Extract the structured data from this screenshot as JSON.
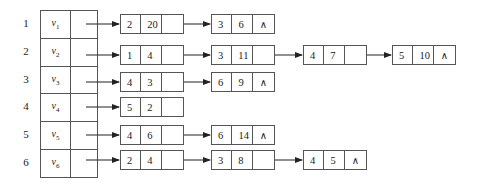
{
  "diagram": {
    "type": "adjacency-list",
    "null_symbol": "∧",
    "vertices": [
      {
        "index": "1",
        "name": "v",
        "sub": "1",
        "edges": [
          {
            "adj": "2",
            "weight": "20"
          },
          {
            "adj": "3",
            "weight": "6"
          }
        ]
      },
      {
        "index": "2",
        "name": "v",
        "sub": "2",
        "edges": [
          {
            "adj": "1",
            "weight": "4"
          },
          {
            "adj": "3",
            "weight": "11"
          },
          {
            "adj": "4",
            "weight": "7"
          },
          {
            "adj": "5",
            "weight": "10"
          }
        ]
      },
      {
        "index": "3",
        "name": "v",
        "sub": "3",
        "edges": [
          {
            "adj": "4",
            "weight": "3"
          },
          {
            "adj": "6",
            "weight": "9"
          }
        ]
      },
      {
        "index": "4",
        "name": "v",
        "sub": "4",
        "edges": [
          {
            "adj": "5",
            "weight": "2"
          }
        ]
      },
      {
        "index": "5",
        "name": "v",
        "sub": "5",
        "edges": [
          {
            "adj": "4",
            "weight": "6"
          },
          {
            "adj": "6",
            "weight": "14"
          }
        ]
      },
      {
        "index": "6",
        "name": "v",
        "sub": "6",
        "edges": [
          {
            "adj": "2",
            "weight": "4"
          },
          {
            "adj": "3",
            "weight": "8"
          },
          {
            "adj": "4",
            "weight": "5"
          }
        ]
      }
    ]
  },
  "colors": {
    "line": "#555555",
    "text": "#222222",
    "background": "#ffffff"
  }
}
